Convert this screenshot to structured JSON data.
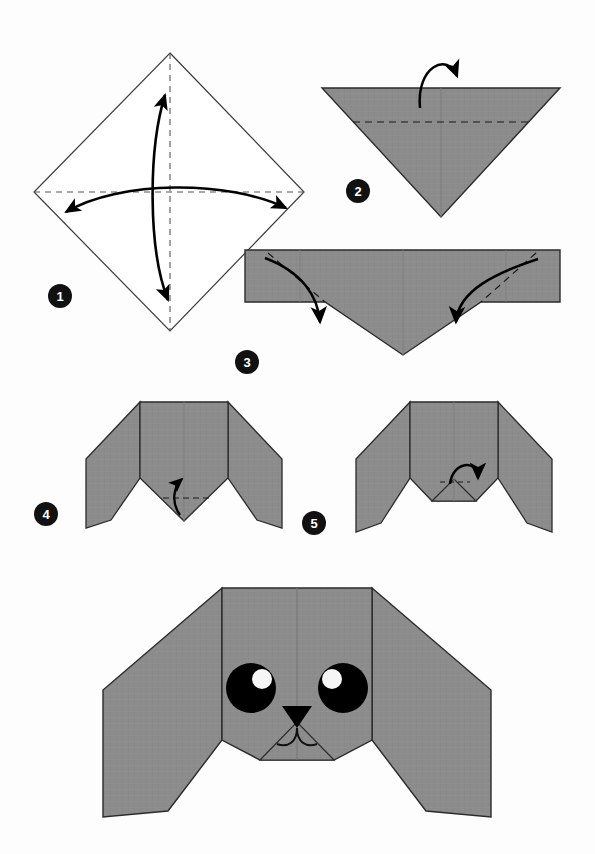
{
  "document": {
    "title": "Origami Dog Head Folding Instructions",
    "background_color": "#fdfdfd",
    "paper_color": "#8c8c8c",
    "paper_edge_color": "#2b2b2b",
    "fold_line_color": "#1a1a1a",
    "arrow_color": "#000000",
    "badge_color": "#111111",
    "badge_text_color": "#ffffff",
    "eye_color": "#000000",
    "eye_highlight_color": "#ffffff",
    "nose_color": "#000000"
  },
  "steps": [
    {
      "number": "1",
      "badge_x": 60,
      "badge_y": 296,
      "label": "Fold and unfold both diagonals of the square",
      "shape": "white-diamond",
      "fold_lines": [
        "vertical-diagonal",
        "horizontal-diagonal"
      ],
      "arrows": [
        "double-headed-vertical",
        "double-headed-horizontal"
      ]
    },
    {
      "number": "2",
      "badge_x": 358,
      "badge_y": 191,
      "label": "Fold the top edge down along the dashed line",
      "shape": "gray-down-triangle",
      "fold_lines": [
        "horizontal"
      ],
      "arrows": [
        "fold-down"
      ]
    },
    {
      "number": "3",
      "badge_x": 247,
      "badge_y": 362,
      "label": "Fold both upper corners down to form the ears",
      "shape": "gray-wide-band-triangle",
      "fold_lines": [
        "diagonal-left",
        "diagonal-right"
      ],
      "arrows": [
        "fold-down-left",
        "fold-down-right"
      ]
    },
    {
      "number": "4",
      "badge_x": 46,
      "badge_y": 514,
      "label": "Fold the bottom point up along the dashed line",
      "shape": "dog-head-with-ears",
      "fold_lines": [
        "horizontal-short"
      ],
      "arrows": [
        "fold-up"
      ]
    },
    {
      "number": "5",
      "badge_x": 314,
      "badge_y": 523,
      "label": "Fold the small tip back down to shape the muzzle",
      "shape": "dog-head-with-folded-chin",
      "fold_lines": [
        "horizontal-tiny"
      ],
      "arrows": [
        "fold-down-small"
      ]
    }
  ],
  "final_model": {
    "label": "Finished origami dog head",
    "face": {
      "left_eye": {
        "cx": 251,
        "cy": 688,
        "r": 25,
        "highlight_cx": 261,
        "highlight_cy": 680,
        "highlight_r": 10
      },
      "right_eye": {
        "cx": 343,
        "cy": 688,
        "r": 25,
        "highlight_cx": 333,
        "highlight_cy": 680,
        "highlight_r": 10
      },
      "nose": {
        "cx": 297,
        "cy": 718,
        "width": 30,
        "height": 22
      },
      "mouth": {
        "description": "two curved arcs forming a smile"
      }
    }
  }
}
